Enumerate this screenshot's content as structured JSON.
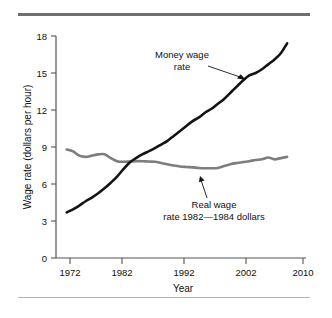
{
  "figure": {
    "name": "money-and-real-wage-rate-chart",
    "rules": {
      "top_rule": "horizontal-rule",
      "bottom_rule": "horizontal-rule"
    }
  },
  "chart_data": {
    "type": "line",
    "title": "",
    "xlabel": "Year",
    "ylabel": "Wage rate (dollars per hour)",
    "xlim": [
      1970.3,
      2010
    ],
    "ylim": [
      0,
      18
    ],
    "xticks": [
      1972,
      1982,
      1992,
      2002,
      2010
    ],
    "xticklabels": [
      "1972",
      "1982",
      "1992",
      "2002",
      "2010"
    ],
    "yticks": [
      0,
      3,
      6,
      9,
      12,
      15,
      18
    ],
    "yticklabels": [
      "0",
      "3",
      "6",
      "9",
      "12",
      "15",
      "18"
    ],
    "grid": false,
    "legend": "annotations",
    "series": [
      {
        "name": "Money wage rate",
        "color": "#141414",
        "x": [
          1972,
          1973,
          1974,
          1975,
          1976,
          1977,
          1978,
          1979,
          1980,
          1981,
          1982,
          1983,
          1984,
          1985,
          1986,
          1987,
          1988,
          1989,
          1990,
          1991,
          1992,
          1993,
          1994,
          1995,
          1996,
          1997,
          1998,
          1999,
          2000,
          2001,
          2002,
          2003,
          2004,
          2005,
          2006,
          2007
        ],
        "values": [
          3.7,
          3.95,
          4.25,
          4.6,
          4.9,
          5.25,
          5.65,
          6.1,
          6.6,
          7.2,
          7.75,
          8.1,
          8.4,
          8.65,
          8.9,
          9.2,
          9.5,
          9.9,
          10.3,
          10.7,
          11.1,
          11.4,
          11.8,
          12.1,
          12.5,
          12.9,
          13.4,
          13.9,
          14.4,
          14.8,
          15.0,
          15.3,
          15.7,
          16.1,
          16.6,
          17.4
        ]
      },
      {
        "name": "Real wage rate 1982—1984 dollars",
        "color": "#7d7d7d",
        "x": [
          1972,
          1973,
          1974,
          1975,
          1976,
          1977,
          1978,
          1979,
          1980,
          1981,
          1982,
          1983,
          1984,
          1985,
          1986,
          1987,
          1988,
          1989,
          1990,
          1991,
          1992,
          1993,
          1994,
          1995,
          1996,
          1997,
          1998,
          1999,
          2000,
          2001,
          2002,
          2003,
          2004,
          2005,
          2006,
          2007
        ],
        "values": [
          8.8,
          8.65,
          8.3,
          8.2,
          8.3,
          8.4,
          8.42,
          8.1,
          7.85,
          7.8,
          7.82,
          7.85,
          7.85,
          7.82,
          7.8,
          7.7,
          7.6,
          7.5,
          7.42,
          7.38,
          7.35,
          7.3,
          7.28,
          7.28,
          7.3,
          7.45,
          7.6,
          7.7,
          7.78,
          7.85,
          7.95,
          8.0,
          8.15,
          8.0,
          8.1,
          8.2
        ]
      }
    ],
    "annotations": [
      {
        "id": "money-wage-annotation",
        "lines": [
          "Money wage",
          "rate"
        ],
        "points_to": {
          "x": 2002.0,
          "y": 15.0
        }
      },
      {
        "id": "real-wage-annotation",
        "lines": [
          "Real wage",
          "rate 1982—1984 dollars"
        ],
        "points_to": {
          "x": 1996.0,
          "y": 7.3
        }
      }
    ]
  }
}
